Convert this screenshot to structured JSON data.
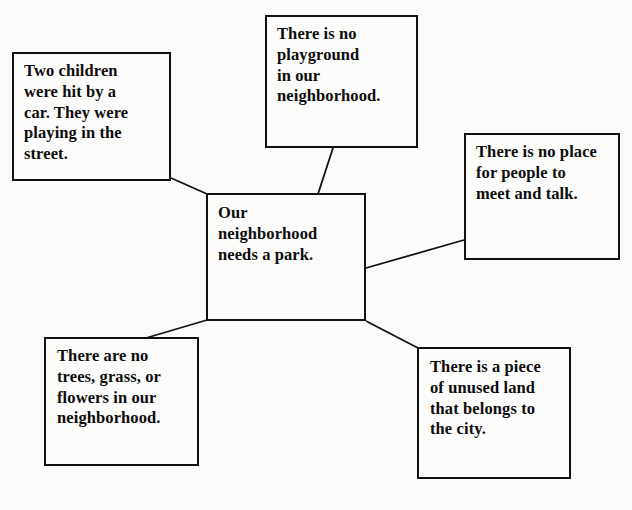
{
  "diagram": {
    "type": "idea-web",
    "background_color": "#fbfbfa",
    "line_color": "#111111",
    "text_color": "#0d0d0d",
    "center": {
      "id": "center",
      "text": "Our\nneighborhood\nneeds a park."
    },
    "nodes": [
      {
        "id": "top-left",
        "text": "Two children\nwere hit by a\ncar. They were\nplaying in the\nstreet."
      },
      {
        "id": "top",
        "text": "There is no\nplayground\nin our\nneighborhood."
      },
      {
        "id": "right",
        "text": "There is no place\nfor people to\nmeet and talk."
      },
      {
        "id": "bottom-left",
        "text": "There are no\ntrees, grass, or\nflowers in our\nneighborhood."
      },
      {
        "id": "bottom-right",
        "text": "There is a piece\nof unused land\nthat belongs to\nthe city."
      }
    ],
    "connectors": [
      {
        "id": "center-to-top-left",
        "from": "center",
        "to": "top-left",
        "x1": 207,
        "y1": 194,
        "x2": 171,
        "y2": 178
      },
      {
        "id": "center-to-top",
        "from": "center",
        "to": "top",
        "x1": 318,
        "y1": 194,
        "x2": 333,
        "y2": 148
      },
      {
        "id": "center-to-right",
        "from": "center",
        "to": "right",
        "x1": 366,
        "y1": 268,
        "x2": 464,
        "y2": 240
      },
      {
        "id": "center-to-bottom-left",
        "from": "center",
        "to": "bottom-left",
        "x1": 207,
        "y1": 320,
        "x2": 146,
        "y2": 338
      },
      {
        "id": "center-to-bottom-right",
        "from": "center",
        "to": "bottom-right",
        "x1": 366,
        "y1": 321,
        "x2": 418,
        "y2": 348
      }
    ]
  }
}
